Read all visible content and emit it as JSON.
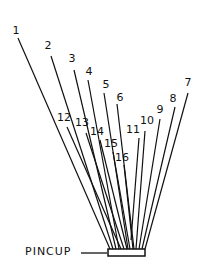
{
  "diagram": {
    "pincup_label": "PINCUP",
    "pincup": {
      "x": 108,
      "y": 249,
      "w": 37,
      "h": 7
    },
    "leader": {
      "x1": 81,
      "y1": 253,
      "x2": 107,
      "y2": 253
    },
    "stroke_color": "#111111",
    "lines": [
      {
        "label": "1",
        "lx": 16,
        "ly": 30,
        "x1": 18,
        "y1": 38,
        "x2": 110,
        "y2": 249
      },
      {
        "label": "2",
        "lx": 48,
        "ly": 45,
        "x1": 51,
        "y1": 56,
        "x2": 113,
        "y2": 249
      },
      {
        "label": "3",
        "lx": 72,
        "ly": 58,
        "x1": 74,
        "y1": 70,
        "x2": 116,
        "y2": 249
      },
      {
        "label": "4",
        "lx": 89,
        "ly": 71,
        "x1": 88,
        "y1": 80,
        "x2": 119,
        "y2": 249
      },
      {
        "label": "5",
        "lx": 106,
        "ly": 84,
        "x1": 104,
        "y1": 93,
        "x2": 128,
        "y2": 249
      },
      {
        "label": "6",
        "lx": 120,
        "ly": 97,
        "x1": 117,
        "y1": 104,
        "x2": 134,
        "y2": 249
      },
      {
        "label": "7",
        "lx": 188,
        "ly": 82,
        "x1": 188,
        "y1": 93,
        "x2": 145,
        "y2": 249
      },
      {
        "label": "8",
        "lx": 173,
        "ly": 98,
        "x1": 175,
        "y1": 107,
        "x2": 142,
        "y2": 249
      },
      {
        "label": "9",
        "lx": 160,
        "ly": 109,
        "x1": 160,
        "y1": 119,
        "x2": 139,
        "y2": 249
      },
      {
        "label": "10",
        "lx": 147,
        "ly": 120,
        "x1": 145,
        "y1": 131,
        "x2": 136,
        "y2": 249
      },
      {
        "label": "11",
        "lx": 133,
        "ly": 129,
        "x1": 139,
        "y1": 138,
        "x2": 131,
        "y2": 240
      },
      {
        "label": "12",
        "lx": 64,
        "ly": 117,
        "x1": 67,
        "y1": 127,
        "x2": 121,
        "y2": 249
      },
      {
        "label": "13",
        "lx": 82,
        "ly": 122,
        "x1": 86,
        "y1": 133,
        "x2": 124,
        "y2": 249
      },
      {
        "label": "14",
        "lx": 97,
        "ly": 131,
        "x1": 100,
        "y1": 140,
        "x2": 127,
        "y2": 249
      },
      {
        "label": "15",
        "lx": 111,
        "ly": 143,
        "x1": 113,
        "y1": 152,
        "x2": 130,
        "y2": 249
      },
      {
        "label": "16",
        "lx": 122,
        "ly": 157,
        "x1": 124,
        "y1": 165,
        "x2": 133,
        "y2": 249
      }
    ]
  }
}
